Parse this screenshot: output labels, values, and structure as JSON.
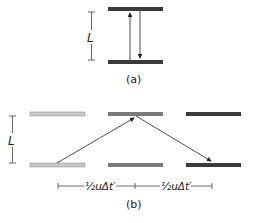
{
  "panel_a": {
    "length_label": "L",
    "caption": "(a)"
  },
  "panel_b": {
    "length_label": "L",
    "caption": "(b)",
    "distance_labels": [
      "½uΔt′",
      "½uΔt′"
    ]
  },
  "colors": {
    "mirror_dark": "#3a3a3a",
    "mirror_medium": "#7a7a7a",
    "mirror_light": "#c8c8c8",
    "line": "#222222"
  }
}
